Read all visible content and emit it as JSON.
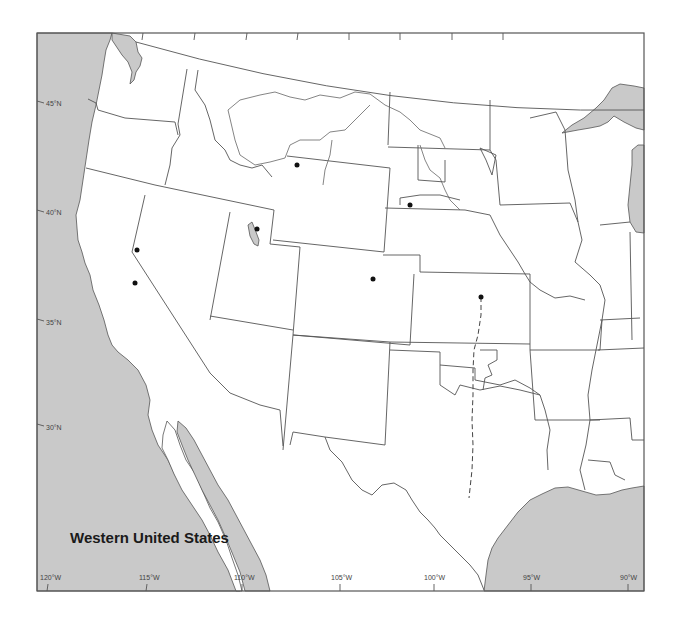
{
  "map": {
    "title": "Western United States",
    "colors": {
      "water": "#c9c9c9",
      "land": "#ffffff",
      "border": "#555555",
      "point": "#111111"
    },
    "latitude_labels": [
      {
        "label": "45°N",
        "y": 103
      },
      {
        "label": "40°N",
        "y": 213
      },
      {
        "label": "35°N",
        "y": 322
      },
      {
        "label": "30°N",
        "y": 427
      }
    ],
    "longitude_labels": [
      {
        "label": "120°W",
        "x": 48
      },
      {
        "label": "115°W",
        "x": 146
      },
      {
        "label": "110°W",
        "x": 242
      },
      {
        "label": "105°W",
        "x": 339
      },
      {
        "label": "100°W",
        "x": 433
      },
      {
        "label": "95°W",
        "x": 531
      },
      {
        "label": "90°W",
        "x": 627
      }
    ],
    "points": [
      {
        "id": "nevada-north",
        "x": 137,
        "y": 250
      },
      {
        "id": "nevada-south",
        "x": 135,
        "y": 283
      },
      {
        "id": "great-salt-lake",
        "x": 257,
        "y": 229
      },
      {
        "id": "wyoming-northwest",
        "x": 297,
        "y": 165
      },
      {
        "id": "nebraska-north",
        "x": 410,
        "y": 205
      },
      {
        "id": "colorado",
        "x": 373,
        "y": 279
      },
      {
        "id": "kansas",
        "x": 481,
        "y": 297
      }
    ],
    "trail": {
      "name": "dashed-route"
    }
  }
}
